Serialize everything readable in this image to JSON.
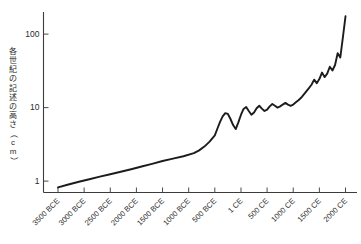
{
  "chart_data": {
    "type": "line",
    "title": "",
    "subtitle": "",
    "xlabel": "",
    "ylabel": "各世紀の記述の高さ（cm）",
    "ylabel_chars": [
      "各",
      "世",
      "紀",
      "の",
      "記",
      "述",
      "の",
      "高",
      "さ",
      "（",
      "c",
      "m",
      "）"
    ],
    "yscale": "log",
    "ylim": [
      0.7,
      200
    ],
    "ytick_labels": [
      "100",
      "10",
      "1"
    ],
    "ytick_values": [
      100,
      10,
      1
    ],
    "xtick_labels": [
      "3500 BCE",
      "3000 BCE",
      "2500 BCE",
      "2000 BCE",
      "1500 BCE",
      "1000 BCE",
      "500 BCE",
      "1 CE",
      "500 CE",
      "1000 CE",
      "1500 CE",
      "2000 CE"
    ],
    "xtick_values": [
      -3500,
      -3000,
      -2500,
      -2000,
      -1500,
      -1000,
      -500,
      1,
      500,
      1000,
      1500,
      2000
    ],
    "xlim": [
      -3500,
      2000
    ],
    "grid": false,
    "legend": false,
    "legend_position": "none",
    "line_color": "#1c1c1c",
    "axis_color": "#3c3c3c",
    "background_color": "#ffffff",
    "series": [
      {
        "name": "各世紀の記述の高さ",
        "x": [
          -3500,
          -3300,
          -3100,
          -2900,
          -2700,
          -2500,
          -2300,
          -2100,
          -1900,
          -1700,
          -1500,
          -1300,
          -1100,
          -900,
          -800,
          -700,
          -600,
          -500,
          -450,
          -400,
          -350,
          -300,
          -250,
          -200,
          -150,
          -100,
          -50,
          1,
          50,
          100,
          150,
          200,
          250,
          300,
          350,
          400,
          450,
          500,
          550,
          600,
          650,
          700,
          750,
          800,
          850,
          900,
          950,
          1000,
          1050,
          1100,
          1150,
          1200,
          1250,
          1300,
          1350,
          1400,
          1450,
          1500,
          1550,
          1600,
          1650,
          1700,
          1750,
          1800,
          1850,
          1900,
          1950,
          2000
        ],
        "y": [
          0.82,
          0.9,
          0.98,
          1.06,
          1.15,
          1.24,
          1.34,
          1.45,
          1.58,
          1.72,
          1.88,
          2.02,
          2.18,
          2.4,
          2.62,
          2.95,
          3.45,
          4.2,
          5.2,
          6.4,
          7.6,
          8.4,
          8.2,
          7.0,
          5.8,
          5.1,
          6.3,
          8.0,
          9.6,
          10.2,
          9.0,
          8.0,
          8.6,
          9.8,
          10.6,
          9.7,
          9.0,
          9.4,
          10.4,
          11.2,
          10.6,
          10.0,
          10.4,
          11.0,
          11.6,
          11.0,
          10.6,
          11.0,
          11.8,
          12.6,
          13.6,
          15.0,
          16.6,
          18.4,
          20.5,
          24.0,
          21.5,
          24.5,
          30.0,
          26.0,
          29.0,
          36.0,
          32.0,
          38.0,
          55.0,
          48.0,
          90.0,
          175.0
        ]
      }
    ]
  }
}
